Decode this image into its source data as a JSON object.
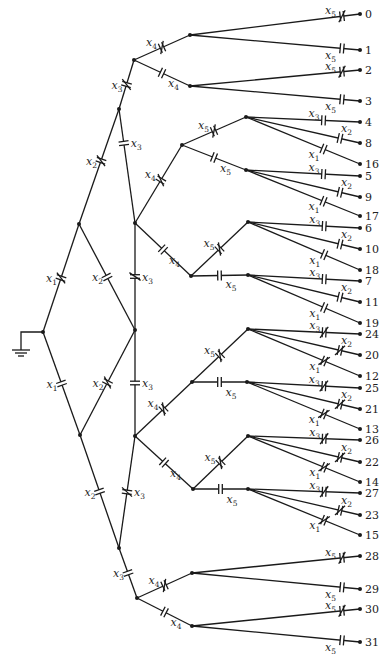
{
  "diagram": {
    "ground": {
      "node": [
        43,
        332
      ],
      "corner": [
        21,
        332
      ],
      "symbol": [
        21,
        350
      ]
    },
    "nodes": {
      "R": [
        43,
        332
      ],
      "U1": [
        79,
        224
      ],
      "L1": [
        80,
        435
      ],
      "U2": [
        119,
        109
      ],
      "M": [
        135,
        330
      ],
      "L2": [
        119,
        548
      ],
      "T": [
        134,
        60
      ],
      "P1": [
        135,
        223
      ],
      "P2": [
        135,
        436
      ],
      "B": [
        137,
        598
      ],
      "a0": [
        190,
        35
      ],
      "a1": [
        190,
        86
      ],
      "b0": [
        182,
        145
      ],
      "b1": [
        191,
        276
      ],
      "c0": [
        192,
        382
      ],
      "c1": [
        193,
        489
      ],
      "d0": [
        192,
        573
      ],
      "d1": [
        192,
        626
      ],
      "e0": [
        246,
        117
      ],
      "e1": [
        246,
        170
      ],
      "e2": [
        248,
        222
      ],
      "e3": [
        248,
        275
      ],
      "e4": [
        248,
        329
      ],
      "e5": [
        247,
        382
      ],
      "e6": [
        248,
        436
      ],
      "e7": [
        248,
        489
      ]
    },
    "edges": [
      {
        "from": "R",
        "to": "U1",
        "label": "x1",
        "cut": true,
        "t": 0.5,
        "lside": "l"
      },
      {
        "from": "R",
        "to": "L1",
        "label": "x1",
        "cut": false,
        "t": 0.5,
        "lside": "l"
      },
      {
        "from": "U1",
        "to": "U2",
        "label": "x2",
        "cut": true,
        "t": 0.55,
        "lside": "l"
      },
      {
        "from": "U1",
        "to": "M",
        "label": "x2",
        "cut": false,
        "t": 0.5,
        "lside": "l"
      },
      {
        "from": "L1",
        "to": "M",
        "label": "x2",
        "cut": true,
        "t": 0.5,
        "lside": "l"
      },
      {
        "from": "L1",
        "to": "L2",
        "label": "x2",
        "cut": false,
        "t": 0.5,
        "lside": "l"
      },
      {
        "from": "U2",
        "to": "T",
        "label": "x3",
        "cut": true,
        "t": 0.5,
        "lside": "l"
      },
      {
        "from": "U2",
        "to": "P1",
        "label": "x3",
        "cut": false,
        "t": 0.3,
        "lside": "r"
      },
      {
        "from": "M",
        "to": "P1",
        "label": "x3",
        "cut": true,
        "t": 0.5,
        "lside": "r"
      },
      {
        "from": "M",
        "to": "P2",
        "label": "x3",
        "cut": false,
        "t": 0.5,
        "lside": "r"
      },
      {
        "from": "L2",
        "to": "P2",
        "label": "x3",
        "cut": true,
        "t": 0.5,
        "lside": "r"
      },
      {
        "from": "L2",
        "to": "B",
        "label": "x3",
        "cut": false,
        "t": 0.5,
        "lside": "l"
      },
      {
        "from": "T",
        "to": "a0",
        "label": "x4",
        "cut": true,
        "t": 0.5,
        "lside": "l"
      },
      {
        "from": "T",
        "to": "a1",
        "label": "x4",
        "cut": false,
        "t": 0.5,
        "lside": "r"
      },
      {
        "from": "P1",
        "to": "b0",
        "label": "x4",
        "cut": true,
        "t": 0.55,
        "lside": "l"
      },
      {
        "from": "P1",
        "to": "b1",
        "label": "x4",
        "cut": false,
        "t": 0.5,
        "lside": "r"
      },
      {
        "from": "P2",
        "to": "c0",
        "label": "x4",
        "cut": true,
        "t": 0.5,
        "lside": "l"
      },
      {
        "from": "P2",
        "to": "c1",
        "label": "x4",
        "cut": false,
        "t": 0.5,
        "lside": "r"
      },
      {
        "from": "B",
        "to": "d0",
        "label": "x4",
        "cut": true,
        "t": 0.5,
        "lside": "l"
      },
      {
        "from": "B",
        "to": "d1",
        "label": "x4",
        "cut": false,
        "t": 0.5,
        "lside": "r"
      },
      {
        "from": "b0",
        "to": "e0",
        "label": "x5",
        "cut": true,
        "t": 0.5,
        "lside": "l"
      },
      {
        "from": "b0",
        "to": "e1",
        "label": "x5",
        "cut": false,
        "t": 0.5,
        "lside": "r"
      },
      {
        "from": "b1",
        "to": "e2",
        "label": "x5",
        "cut": true,
        "t": 0.5,
        "lside": "l"
      },
      {
        "from": "b1",
        "to": "e3",
        "label": "x5",
        "cut": false,
        "t": 0.5,
        "lside": "r"
      },
      {
        "from": "c0",
        "to": "e4",
        "label": "x5",
        "cut": true,
        "t": 0.5,
        "lside": "l"
      },
      {
        "from": "c0",
        "to": "e5",
        "label": "x5",
        "cut": false,
        "t": 0.5,
        "lside": "r"
      },
      {
        "from": "c1",
        "to": "e6",
        "label": "x5",
        "cut": true,
        "t": 0.5,
        "lside": "l"
      },
      {
        "from": "c1",
        "to": "e7",
        "label": "x5",
        "cut": false,
        "t": 0.5,
        "lside": "r"
      }
    ],
    "outputs": [
      {
        "from": "a0",
        "y": 14,
        "num": "0",
        "label": "x5",
        "cut": true
      },
      {
        "from": "a0",
        "y": 50,
        "num": "1",
        "label": "x5",
        "cut": false
      },
      {
        "from": "a1",
        "y": 70,
        "num": "2",
        "label": "x5",
        "cut": true
      },
      {
        "from": "a1",
        "y": 101,
        "num": "3",
        "label": "x5",
        "cut": false
      },
      {
        "from": "e0",
        "y": 122,
        "num": "4",
        "label": "x3",
        "cut": false
      },
      {
        "from": "e0",
        "y": 143,
        "num": "8",
        "label": "x2",
        "cut": false
      },
      {
        "from": "e0",
        "y": 164,
        "num": "16",
        "label": "x1",
        "cut": false
      },
      {
        "from": "e1",
        "y": 176,
        "num": "5",
        "label": "x3",
        "cut": false
      },
      {
        "from": "e1",
        "y": 197,
        "num": "9",
        "label": "x2",
        "cut": false
      },
      {
        "from": "e1",
        "y": 216,
        "num": "17",
        "label": "x1",
        "cut": false
      },
      {
        "from": "e2",
        "y": 228,
        "num": "6",
        "label": "x3",
        "cut": false
      },
      {
        "from": "e2",
        "y": 249,
        "num": "10",
        "label": "x2",
        "cut": false
      },
      {
        "from": "e2",
        "y": 270,
        "num": "18",
        "label": "x1",
        "cut": false
      },
      {
        "from": "e3",
        "y": 281,
        "num": "7",
        "label": "x3",
        "cut": false
      },
      {
        "from": "e3",
        "y": 302,
        "num": "11",
        "label": "x2",
        "cut": false
      },
      {
        "from": "e3",
        "y": 323,
        "num": "19",
        "label": "x1",
        "cut": false
      },
      {
        "from": "e4",
        "y": 334,
        "num": "24",
        "label": "x3",
        "cut": true
      },
      {
        "from": "e4",
        "y": 355,
        "num": "20",
        "label": "x2",
        "cut": true
      },
      {
        "from": "e4",
        "y": 376,
        "num": "12",
        "label": "x1",
        "cut": true
      },
      {
        "from": "e5",
        "y": 388,
        "num": "25",
        "label": "x3",
        "cut": true
      },
      {
        "from": "e5",
        "y": 409,
        "num": "21",
        "label": "x2",
        "cut": true
      },
      {
        "from": "e5",
        "y": 429,
        "num": "13",
        "label": "x1",
        "cut": true
      },
      {
        "from": "e6",
        "y": 440,
        "num": "26",
        "label": "x3",
        "cut": true
      },
      {
        "from": "e6",
        "y": 462,
        "num": "22",
        "label": "x2",
        "cut": true
      },
      {
        "from": "e6",
        "y": 482,
        "num": "14",
        "label": "x1",
        "cut": true
      },
      {
        "from": "e7",
        "y": 493,
        "num": "27",
        "label": "x3",
        "cut": true
      },
      {
        "from": "e7",
        "y": 515,
        "num": "23",
        "label": "x2",
        "cut": true
      },
      {
        "from": "e7",
        "y": 535,
        "num": "15",
        "label": "x1",
        "cut": true
      },
      {
        "from": "d0",
        "y": 556,
        "num": "28",
        "label": "x5",
        "cut": true
      },
      {
        "from": "d0",
        "y": 589,
        "num": "29",
        "label": "x5",
        "cut": false
      },
      {
        "from": "d1",
        "y": 609,
        "num": "30",
        "label": "x5",
        "cut": true
      },
      {
        "from": "d1",
        "y": 642,
        "num": "31",
        "label": "x5",
        "cut": false
      }
    ],
    "terminal_x": 360
  }
}
